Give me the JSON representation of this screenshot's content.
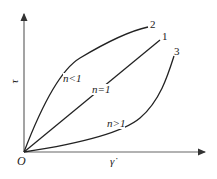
{
  "diagram": {
    "type": "flow-curves",
    "axes": {
      "y_label": "τ",
      "x_label": "γ̇",
      "origin_label": "O"
    },
    "curves": [
      {
        "id": "2",
        "number_label": "2",
        "region_label": "n<1",
        "shape": "concave-down"
      },
      {
        "id": "1",
        "number_label": "1",
        "region_label": "n=1",
        "shape": "linear"
      },
      {
        "id": "3",
        "number_label": "3",
        "region_label": "n>1",
        "shape": "concave-up"
      }
    ],
    "colors": {
      "line": "#222222",
      "axis": "#555555",
      "background": "#ffffff"
    }
  }
}
